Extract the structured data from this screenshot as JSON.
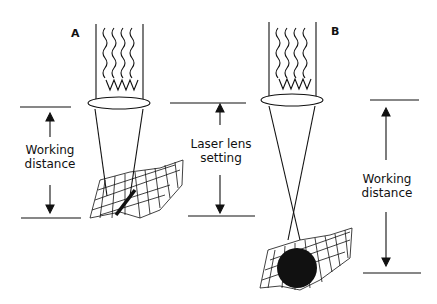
{
  "panels": [
    {
      "id": "A",
      "letter": "A",
      "left_label": [
        "Working",
        "distance"
      ]
    },
    {
      "id": "B",
      "letter": "B",
      "right_label": [
        "Working",
        "distance"
      ]
    }
  ],
  "middle_label": [
    "Laser lens",
    "setting"
  ],
  "colors": {
    "ink": "#111111",
    "background": "#ffffff"
  }
}
